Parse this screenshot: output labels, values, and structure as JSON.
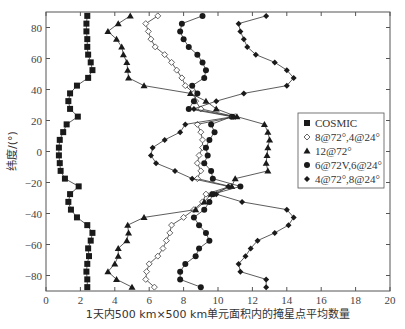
{
  "chart_data": {
    "type": "line",
    "title": "",
    "xlabel": "1天内500 km×500 km单元面积内的掩星点平均数量",
    "ylabel": "纬度/(°)",
    "xlim": [
      0,
      20
    ],
    "ylim": [
      -90,
      90
    ],
    "xticks": [
      0,
      2,
      4,
      6,
      8,
      10,
      12,
      14,
      16,
      18,
      20
    ],
    "yticks": [
      -80,
      -60,
      -40,
      -20,
      0,
      20,
      40,
      60,
      80
    ],
    "grid": false,
    "legend_position": "right-center",
    "y": [
      87.5,
      82.5,
      77.5,
      72.5,
      67.5,
      62.5,
      57.5,
      52.5,
      47.5,
      42.5,
      37.5,
      32.5,
      27.5,
      22.5,
      17.5,
      12.5,
      7.5,
      2.5,
      -2.5,
      -7.5,
      -12.5,
      -17.5,
      -22.5,
      -27.5,
      -32.5,
      -37.5,
      -42.5,
      -47.5,
      -52.5,
      -57.5,
      -62.5,
      -67.5,
      -72.5,
      -77.5,
      -82.5,
      -87.5
    ],
    "series": [
      {
        "name": "COSMIC",
        "marker": "filled-square",
        "values": [
          2.4,
          2.35,
          2.35,
          2.4,
          2.4,
          2.45,
          2.6,
          2.7,
          2.45,
          1.8,
          1.4,
          1.3,
          1.4,
          1.85,
          1.2,
          1.0,
          0.8,
          0.75,
          0.75,
          0.8,
          0.85,
          1.1,
          1.9,
          1.4,
          1.3,
          1.45,
          1.8,
          2.4,
          2.7,
          2.6,
          2.45,
          2.5,
          2.4,
          2.35,
          2.4,
          2.4
        ]
      },
      {
        "name": "8@72°,4@24°",
        "marker": "open-diamond",
        "values": [
          6.5,
          5.8,
          5.95,
          6.1,
          6.35,
          6.9,
          7.3,
          7.6,
          7.9,
          8.1,
          8.6,
          8.7,
          9.0,
          11.0,
          8.8,
          9.0,
          9.1,
          9.1,
          8.9,
          8.8,
          9.0,
          8.8,
          10.7,
          9.3,
          9.1,
          8.6,
          8.0,
          7.3,
          7.2,
          7.0,
          6.8,
          6.5,
          6.0,
          5.85,
          5.8,
          6.3
        ]
      },
      {
        "name": "12@72°",
        "marker": "filled-triangle",
        "values": [
          4.9,
          4.2,
          3.6,
          4.1,
          4.4,
          4.5,
          4.7,
          4.75,
          4.8,
          5.7,
          8.4,
          9.3,
          9.9,
          11.1,
          12.7,
          12.9,
          13.0,
          12.9,
          12.85,
          12.8,
          12.9,
          11.0,
          10.8,
          9.6,
          9.2,
          8.7,
          5.7,
          4.75,
          4.8,
          4.7,
          4.2,
          4.2,
          4.0,
          3.6,
          4.1,
          5.0
        ]
      },
      {
        "name": "6@72V,6@24°",
        "marker": "filled-circle",
        "values": [
          9.1,
          7.9,
          7.8,
          8.0,
          8.3,
          8.8,
          9.1,
          9.3,
          9.2,
          8.5,
          8.8,
          8.6,
          8.3,
          10.8,
          9.6,
          9.8,
          9.5,
          9.3,
          9.4,
          9.2,
          9.6,
          9.7,
          11.3,
          9.7,
          9.5,
          9.2,
          8.6,
          8.9,
          9.3,
          9.5,
          8.9,
          8.7,
          8.1,
          7.8,
          7.8,
          9.0
        ]
      },
      {
        "name": "4@72°,8@24°",
        "marker": "filled-diamond",
        "values": [
          12.8,
          11.2,
          11.3,
          11.5,
          11.7,
          12.2,
          13.3,
          14.0,
          14.4,
          14.0,
          11.5,
          9.9,
          8.6,
          10.9,
          8.1,
          7.8,
          6.9,
          6.2,
          6.1,
          6.4,
          7.5,
          8.5,
          10.6,
          9.9,
          11.4,
          14.0,
          14.4,
          14.1,
          13.3,
          12.3,
          11.9,
          11.6,
          11.2,
          11.3,
          12.8,
          12.8
        ]
      }
    ],
    "legend": [
      "COSMIC",
      "8@72°,4@24°",
      "12@72°",
      "6@72V,6@24°",
      "4@72°,8@24°"
    ]
  }
}
